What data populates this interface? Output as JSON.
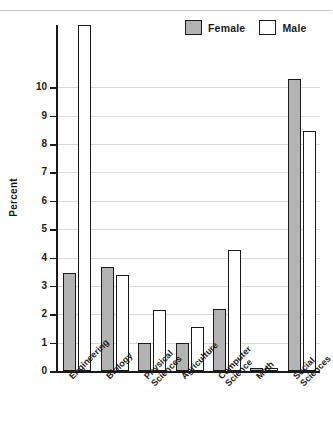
{
  "chart_data": {
    "type": "bar",
    "title": "",
    "subtitle": "",
    "xlabel": "",
    "ylabel": "Percent",
    "ylim": [
      0,
      12.2
    ],
    "yticks": [
      0,
      1,
      2,
      3,
      4,
      5,
      6,
      7,
      8,
      9,
      10
    ],
    "ytick_labels": [
      "0",
      "1",
      "2",
      "3",
      "4",
      "5",
      "6",
      "7",
      "8",
      "9",
      "10"
    ],
    "grid": true,
    "grid_axis": "y",
    "legend_position": "top-right",
    "note": "Engineering Male bar is clipped by the top of the plot area",
    "categories": [
      "Engineering",
      "Biology",
      "Physical Sciences",
      "Agriculture",
      "Computer Science",
      "Math",
      "Social Sciences"
    ],
    "category_lines": [
      [
        "Engineering"
      ],
      [
        "Biology"
      ],
      [
        "Physical",
        "Sciences"
      ],
      [
        "Agriculture"
      ],
      [
        "Computer",
        "Science"
      ],
      [
        "Math"
      ],
      [
        "Social",
        "Sciences"
      ]
    ],
    "series": [
      {
        "name": "Female",
        "color": "#b3b3b3",
        "values": [
          3.45,
          3.65,
          1.0,
          1.0,
          2.2,
          0.1,
          10.3
        ]
      },
      {
        "name": "Male",
        "color": "#ffffff",
        "values": [
          12.2,
          3.4,
          2.15,
          1.55,
          4.25,
          0.1,
          8.45
        ]
      }
    ]
  },
  "legend": {
    "items": [
      {
        "label": "Female",
        "swatch": "gray-swatch"
      },
      {
        "label": "Male",
        "swatch": "white-swatch"
      }
    ]
  },
  "colors": {
    "female_fill": "#b3b3b3",
    "male_fill": "#ffffff",
    "outline": "#1a1a1a",
    "gridline": "#d9d9d9",
    "background": "#ffffff"
  }
}
